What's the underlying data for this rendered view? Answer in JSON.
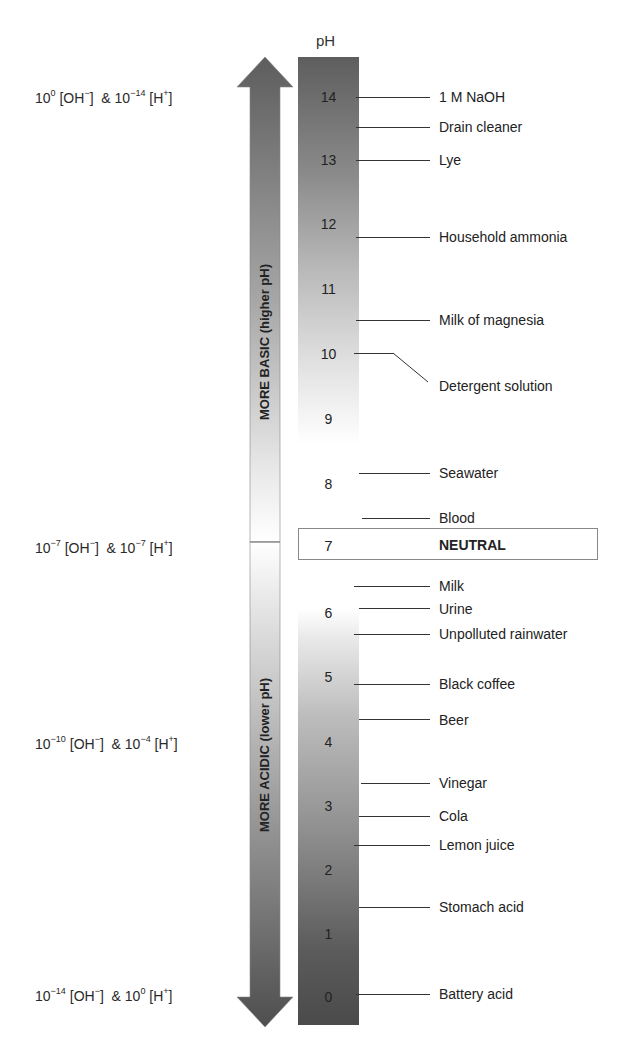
{
  "title": "pH",
  "arrows": {
    "up_label": "MORE BASIC (higher pH)",
    "down_label": "MORE ACIDIC (lower pH)",
    "color": "#5a5a5a"
  },
  "concentrations": [
    {
      "oh_exp": "0",
      "h_exp": "−14",
      "y": 97
    },
    {
      "oh_exp": "−7",
      "h_exp": "−7",
      "y": 547
    },
    {
      "oh_exp": "−10",
      "h_exp": "−4",
      "y": 742
    },
    {
      "oh_exp": "−14",
      "h_exp": "0",
      "y": 997
    }
  ],
  "conc_text": {
    "base": "10",
    "oh": "[OH",
    "oh_charge": "−",
    "amp": "&",
    "h": "[H",
    "h_charge": "+",
    "close": "]"
  },
  "scale_numbers": [
    "14",
    "13",
    "12",
    "11",
    "10",
    "9",
    "8",
    "7",
    "6",
    "5",
    "4",
    "3",
    "2",
    "1",
    "0"
  ],
  "neutral": {
    "value": "7",
    "label": "NEUTRAL"
  },
  "substances": [
    {
      "name": "1 M NaOH",
      "ph": 14.0
    },
    {
      "name": "Drain cleaner",
      "ph": 13.6
    },
    {
      "name": "Lye",
      "ph": 13.0
    },
    {
      "name": "Household ammonia",
      "ph": 11.8
    },
    {
      "name": "Milk of magnesia",
      "ph": 10.5
    },
    {
      "name": "Detergent solution",
      "ph": 10.0
    },
    {
      "name": "Seawater",
      "ph": 8.2
    },
    {
      "name": "Blood",
      "ph": 7.4
    },
    {
      "name": "Milk",
      "ph": 6.5
    },
    {
      "name": "Urine",
      "ph": 6.1
    },
    {
      "name": "Unpolluted rainwater",
      "ph": 5.7
    },
    {
      "name": "Black coffee",
      "ph": 5.0
    },
    {
      "name": "Beer",
      "ph": 4.5
    },
    {
      "name": "Vinegar",
      "ph": 3.4
    },
    {
      "name": "Cola",
      "ph": 2.9
    },
    {
      "name": "Lemon juice",
      "ph": 2.4
    },
    {
      "name": "Stomach acid",
      "ph": 1.4
    },
    {
      "name": "Battery acid",
      "ph": 0.0
    }
  ]
}
